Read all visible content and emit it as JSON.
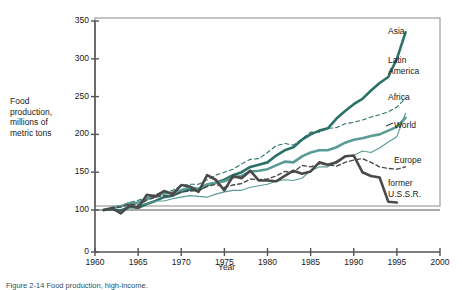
{
  "figure": {
    "caption": "Figure 2-14   Food production, high-income.",
    "ylabel": "Food\nproduction,\nmillions of\nmetric tons",
    "xlabel": "Year"
  },
  "axes": {
    "y_ticks": [
      "0",
      "100",
      "150",
      "200",
      "250",
      "300",
      "350"
    ],
    "x_ticks": [
      "1960",
      "1965",
      "1970",
      "1975",
      "1980",
      "1985",
      "1990",
      "1995",
      "2000"
    ]
  },
  "series_labels": [
    {
      "name": "asia",
      "text": "Asia"
    },
    {
      "name": "latin-america",
      "text": "Latin\nAmerica"
    },
    {
      "name": "africa",
      "text": "Africa"
    },
    {
      "name": "world",
      "text": "World"
    },
    {
      "name": "europe",
      "text": "Europe"
    },
    {
      "name": "former-ussr",
      "text": "former\nU.S.S.R."
    }
  ],
  "colors": {
    "asia": "#2c7168",
    "latin_america": "#2c7168",
    "africa": "#5a9c95",
    "world": "#5a9c95",
    "europe": "#4a4a4a",
    "former_ussr": "#4a4a4a",
    "axis": "#555555",
    "frame": "#8a8a8a",
    "text": "#1a1a1a"
  },
  "chart_data": {
    "type": "line",
    "title": "",
    "xlabel": "Year",
    "ylabel": "Food production, millions of metric tons",
    "xlim": [
      1960,
      2000
    ],
    "ylim": [
      0,
      350
    ],
    "y_ticks": [
      0,
      100,
      150,
      200,
      250,
      300,
      350
    ],
    "x_ticks": [
      1960,
      1965,
      1970,
      1975,
      1980,
      1985,
      1990,
      1995,
      2000
    ],
    "grid": false,
    "reference_line_y": 100,
    "legend": "right-of-plot-inline-labels",
    "note": "Index values, 1961 = 100. Values read from plotted curves.",
    "series": [
      {
        "name": "Asia",
        "style": "solid",
        "width": "thick",
        "color": "#2c7168",
        "x": [
          1961,
          1962,
          1963,
          1964,
          1965,
          1966,
          1967,
          1968,
          1969,
          1970,
          1971,
          1972,
          1973,
          1974,
          1975,
          1976,
          1977,
          1978,
          1979,
          1980,
          1981,
          1982,
          1983,
          1984,
          1985,
          1986,
          1987,
          1988,
          1989,
          1990,
          1991,
          1992,
          1993,
          1994,
          1995,
          1996
        ],
        "y": [
          100,
          101,
          99,
          104,
          103,
          108,
          112,
          117,
          119,
          124,
          127,
          126,
          133,
          136,
          140,
          146,
          150,
          157,
          160,
          163,
          172,
          179,
          183,
          193,
          200,
          205,
          208,
          221,
          231,
          240,
          247,
          258,
          268,
          276,
          300,
          335
        ]
      },
      {
        "name": "Latin America",
        "style": "dashed",
        "width": "thin",
        "color": "#2c7168",
        "x": [
          1961,
          1962,
          1963,
          1964,
          1965,
          1966,
          1967,
          1968,
          1969,
          1970,
          1971,
          1972,
          1973,
          1974,
          1975,
          1976,
          1977,
          1978,
          1979,
          1980,
          1981,
          1982,
          1983,
          1984,
          1985,
          1986,
          1987,
          1988,
          1989,
          1990,
          1991,
          1992,
          1993,
          1994,
          1995,
          1996
        ],
        "y": [
          100,
          104,
          106,
          110,
          113,
          116,
          121,
          124,
          126,
          132,
          134,
          134,
          140,
          146,
          150,
          154,
          161,
          167,
          168,
          176,
          185,
          188,
          186,
          194,
          203,
          203,
          208,
          209,
          214,
          216,
          219,
          223,
          226,
          230,
          236,
          248
        ]
      },
      {
        "name": "Africa",
        "style": "solid",
        "width": "thin",
        "color": "#5a9c95",
        "x": [
          1961,
          1962,
          1963,
          1964,
          1965,
          1966,
          1967,
          1968,
          1969,
          1970,
          1971,
          1972,
          1973,
          1974,
          1975,
          1976,
          1977,
          1978,
          1979,
          1980,
          1981,
          1982,
          1983,
          1984,
          1985,
          1986,
          1987,
          1988,
          1989,
          1990,
          1991,
          1992,
          1993,
          1994,
          1995,
          1996
        ],
        "y": [
          100,
          102,
          105,
          107,
          108,
          108,
          112,
          112,
          115,
          117,
          119,
          118,
          117,
          121,
          124,
          126,
          126,
          130,
          132,
          134,
          138,
          140,
          139,
          142,
          152,
          157,
          157,
          165,
          170,
          172,
          178,
          176,
          182,
          190,
          197,
          228
        ]
      },
      {
        "name": "World",
        "style": "solid",
        "width": "thick",
        "color": "#5a9c95",
        "x": [
          1961,
          1962,
          1963,
          1964,
          1965,
          1966,
          1967,
          1968,
          1969,
          1970,
          1971,
          1972,
          1973,
          1974,
          1975,
          1976,
          1977,
          1978,
          1979,
          1980,
          1981,
          1982,
          1983,
          1984,
          1985,
          1986,
          1987,
          1988,
          1989,
          1990,
          1991,
          1992,
          1993,
          1994,
          1995,
          1996
        ],
        "y": [
          100,
          103,
          105,
          109,
          110,
          115,
          118,
          122,
          123,
          126,
          130,
          128,
          134,
          136,
          138,
          143,
          145,
          151,
          152,
          154,
          159,
          164,
          163,
          171,
          176,
          179,
          179,
          183,
          189,
          193,
          195,
          198,
          200,
          205,
          210,
          222
        ]
      },
      {
        "name": "Europe",
        "style": "dashed",
        "width": "medium",
        "color": "#4a4a4a",
        "x": [
          1961,
          1962,
          1963,
          1964,
          1965,
          1966,
          1967,
          1968,
          1969,
          1970,
          1971,
          1972,
          1973,
          1974,
          1975,
          1976,
          1977,
          1978,
          1979,
          1980,
          1981,
          1982,
          1983,
          1984,
          1985,
          1986,
          1987,
          1988,
          1989,
          1990,
          1991,
          1992,
          1993,
          1994,
          1995,
          1996
        ],
        "y": [
          100,
          103,
          104,
          108,
          106,
          113,
          117,
          119,
          119,
          124,
          125,
          126,
          131,
          134,
          130,
          133,
          135,
          141,
          140,
          141,
          145,
          151,
          150,
          159,
          157,
          161,
          160,
          158,
          163,
          166,
          168,
          163,
          157,
          155,
          154,
          157
        ]
      },
      {
        "name": "former U.S.S.R.",
        "style": "solid",
        "width": "thick",
        "color": "#4a4a4a",
        "x": [
          1961,
          1962,
          1963,
          1964,
          1965,
          1966,
          1967,
          1968,
          1969,
          1970,
          1971,
          1972,
          1973,
          1974,
          1975,
          1976,
          1977,
          1978,
          1979,
          1980,
          1981,
          1982,
          1983,
          1984,
          1985,
          1986,
          1987,
          1988,
          1989,
          1990,
          1991,
          1992,
          1993,
          1994,
          1995
        ],
        "y": [
          100,
          102,
          92,
          106,
          103,
          120,
          118,
          125,
          121,
          133,
          131,
          124,
          146,
          140,
          126,
          145,
          142,
          152,
          139,
          139,
          138,
          145,
          152,
          148,
          151,
          163,
          160,
          163,
          171,
          172,
          150,
          145,
          143,
          111,
          110
        ]
      }
    ]
  }
}
